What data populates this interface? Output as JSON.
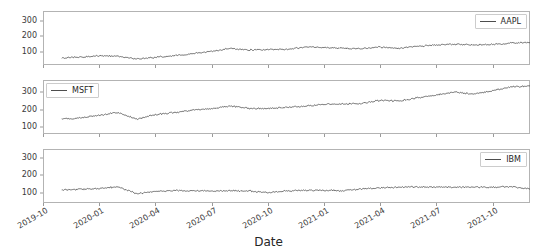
{
  "figure": {
    "width": 537,
    "height": 251,
    "background": "#ffffff",
    "line_color": "#4d4d4d",
    "frame_color": "#b3b3b3",
    "xlabel": "Date",
    "xtick_labels": [
      "2019-10",
      "2020-01",
      "2020-04",
      "2020-07",
      "2020-10",
      "2021-01",
      "2021-04",
      "2021-07",
      "2021-10"
    ],
    "ytick_labels": [
      "100",
      "200",
      "300"
    ]
  },
  "chart_data": {
    "type": "line",
    "title": "",
    "xlabel": "Date",
    "ylabel": "",
    "grid": false,
    "shared_x": true,
    "xlim": [
      "2019-10-01",
      "2021-12-01"
    ],
    "x_tick_values": [
      "2019-10",
      "2020-01",
      "2020-04",
      "2020-07",
      "2020-10",
      "2021-01",
      "2021-04",
      "2021-07",
      "2021-10"
    ],
    "subplots": [
      {
        "legend": "AAPL",
        "legend_position": "upper right",
        "ylim": [
          20,
          360
        ],
        "y_ticks": [
          100,
          200,
          300
        ],
        "x": [
          "2019-11",
          "2019-12",
          "2020-01",
          "2020-02",
          "2020-03",
          "2020-04",
          "2020-05",
          "2020-06",
          "2020-07",
          "2020-08",
          "2020-09",
          "2020-10",
          "2020-11",
          "2020-12",
          "2021-01",
          "2021-02",
          "2021-03",
          "2021-04",
          "2021-05",
          "2021-06",
          "2021-07",
          "2021-08",
          "2021-09",
          "2021-10",
          "2021-11",
          "2021-12"
        ],
        "values": [
          65,
          70,
          78,
          75,
          58,
          68,
          79,
          91,
          106,
          125,
          115,
          117,
          119,
          132,
          132,
          124,
          122,
          133,
          125,
          136,
          146,
          151,
          147,
          149,
          158,
          162
        ]
      },
      {
        "legend": "MSFT",
        "legend_position": "upper left",
        "ylim": [
          60,
          370
        ],
        "y_ticks": [
          100,
          200,
          300
        ],
        "x": [
          "2019-11",
          "2019-12",
          "2020-01",
          "2020-02",
          "2020-03",
          "2020-04",
          "2020-05",
          "2020-06",
          "2020-07",
          "2020-08",
          "2020-09",
          "2020-10",
          "2020-11",
          "2020-12",
          "2021-01",
          "2021-02",
          "2021-03",
          "2021-04",
          "2021-05",
          "2021-06",
          "2021-07",
          "2021-08",
          "2021-09",
          "2021-10",
          "2021-11",
          "2021-12"
        ],
        "values": [
          145,
          152,
          168,
          183,
          145,
          172,
          183,
          197,
          205,
          221,
          207,
          205,
          213,
          219,
          232,
          233,
          236,
          254,
          249,
          268,
          284,
          301,
          289,
          310,
          330,
          336
        ]
      },
      {
        "legend": "IBM",
        "legend_position": "upper right",
        "ylim": [
          40,
          350
        ],
        "y_ticks": [
          100,
          200,
          300
        ],
        "x": [
          "2019-11",
          "2019-12",
          "2020-01",
          "2020-02",
          "2020-03",
          "2020-04",
          "2020-05",
          "2020-06",
          "2020-07",
          "2020-08",
          "2020-09",
          "2020-10",
          "2020-11",
          "2020-12",
          "2021-01",
          "2021-02",
          "2021-03",
          "2021-04",
          "2021-05",
          "2021-06",
          "2021-07",
          "2021-08",
          "2021-09",
          "2021-10",
          "2021-11",
          "2021-12"
        ],
        "values": [
          116,
          118,
          124,
          133,
          94,
          107,
          112,
          110,
          108,
          110,
          110,
          99,
          110,
          112,
          113,
          110,
          121,
          127,
          131,
          133,
          131,
          132,
          130,
          131,
          134,
          121
        ]
      }
    ]
  }
}
